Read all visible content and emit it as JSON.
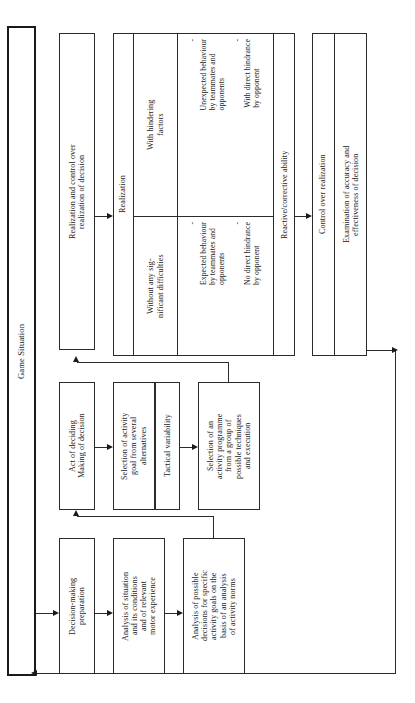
{
  "diagram": {
    "type": "flowchart",
    "orientation": "rotated-90-ccw",
    "outer_frame": {
      "label": "Game Situation"
    },
    "stages": [
      {
        "id": "decision-making-preparation",
        "title": "Decision-making\npreparation",
        "steps": [
          "Analysis of situation\nand its conditions\nand of relevant\nmotor experience",
          "Analysis of possible\ndecisions for specific\nactivity goals on the\nbasis of an analysis\nof activity norms"
        ]
      },
      {
        "id": "act-of-deciding",
        "title": "Act of deciding\nMaking of decision",
        "steps": [
          "Selection of activity\ngoal from several\nalternatives",
          "Tactical  variability",
          "Selection of an\nactivity programme\nfrom a group of\npossible techniques\nand execution"
        ]
      },
      {
        "id": "realization-and-control",
        "title": "Realization and control over\nrealization of decision",
        "groups": [
          {
            "id": "realization",
            "label": "Realization",
            "rows": [
              {
                "id": "without-difficulties",
                "condition": "Without any sig-\nnificant difficulties",
                "items": [
                  "No direct hindrance\nby opponent",
                  "Expected  behaviour\nby teammates and\nopponents"
                ]
              },
              {
                "id": "with-hindering-factors",
                "condition": "With hindering\nfactors",
                "items": [
                  "With direct hindrance\nby opponent",
                  "Unexpected behaviour\nby teammates and\nopponents"
                ]
              }
            ],
            "trailer": "Reactive/corrective ability"
          },
          {
            "id": "control-over-realization",
            "label": "Control over realization",
            "detail": "Examination of accuracy and\neffectiveness of decision"
          }
        ]
      }
    ],
    "bullet_marker": "-",
    "colors": {
      "line": "#2b2b2b",
      "frame": "#1a1a1a",
      "background": "#ffffff",
      "text": "#1a1a1a"
    }
  }
}
